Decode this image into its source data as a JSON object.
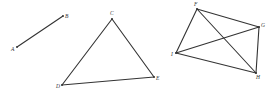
{
  "figures": [
    {
      "name": "segment-AB",
      "points": {
        "A": {
          "x": 17,
          "y": 47,
          "label": "A",
          "lx": 11,
          "ly": 51
        },
        "B": {
          "x": 63,
          "y": 16,
          "label": "B",
          "lx": 65,
          "ly": 18
        }
      },
      "edges": [
        [
          "A",
          "B"
        ]
      ]
    },
    {
      "name": "triangle-CDE",
      "points": {
        "C": {
          "x": 112,
          "y": 19,
          "label": "C",
          "lx": 110,
          "ly": 15
        },
        "D": {
          "x": 62,
          "y": 85,
          "label": "D",
          "lx": 56,
          "ly": 88
        },
        "E": {
          "x": 154,
          "y": 77,
          "label": "E",
          "lx": 156,
          "ly": 80
        }
      },
      "edges": [
        [
          "C",
          "D"
        ],
        [
          "D",
          "E"
        ],
        [
          "E",
          "C"
        ]
      ]
    },
    {
      "name": "quadrilateral-FGHI",
      "points": {
        "F": {
          "x": 197,
          "y": 9,
          "label": "F",
          "lx": 194,
          "ly": 6
        },
        "G": {
          "x": 259,
          "y": 27,
          "label": "G",
          "lx": 261,
          "ly": 27
        },
        "H": {
          "x": 256,
          "y": 73,
          "label": "H",
          "lx": 256,
          "ly": 79
        },
        "I": {
          "x": 176,
          "y": 53,
          "label": "I",
          "lx": 171,
          "ly": 56
        }
      },
      "edges": [
        [
          "F",
          "G"
        ],
        [
          "G",
          "H"
        ],
        [
          "H",
          "I"
        ],
        [
          "I",
          "F"
        ],
        [
          "F",
          "H"
        ],
        [
          "I",
          "G"
        ]
      ]
    }
  ],
  "colors": {
    "stroke": "#333333",
    "background": "#ffffff"
  }
}
